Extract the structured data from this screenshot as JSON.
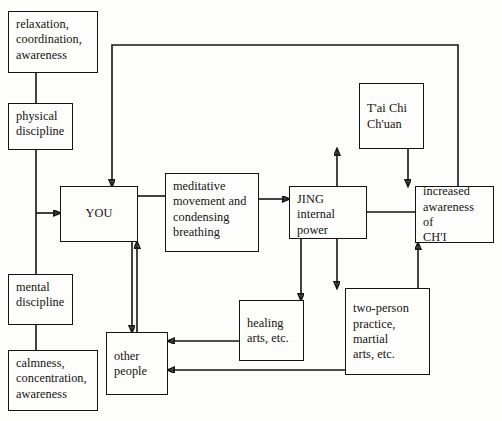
{
  "diagram": {
    "line_color": "#15140f",
    "background_color": "#fdfdfc",
    "nodes": [
      {
        "id": "relaxation",
        "label": "relaxation,\ncoordination,\nawareness",
        "x": 8,
        "y": 11,
        "w": 90,
        "h": 62
      },
      {
        "id": "physical",
        "label": "physical\ndiscipline",
        "x": 8,
        "y": 103,
        "w": 65,
        "h": 47
      },
      {
        "id": "mental",
        "label": "mental\ndiscipline",
        "x": 8,
        "y": 274,
        "w": 65,
        "h": 51
      },
      {
        "id": "calmness",
        "label": "calmness,\nconcentration,\nawareness",
        "x": 8,
        "y": 350,
        "w": 90,
        "h": 61
      },
      {
        "id": "you",
        "label": "YOU",
        "x": 60,
        "y": 186,
        "w": 78,
        "h": 56
      },
      {
        "id": "meditative",
        "label": "meditative\nmovement and\ncondensing\nbreathing",
        "x": 165,
        "y": 173,
        "w": 94,
        "h": 79
      },
      {
        "id": "jing",
        "label": "JING\ninternal\npower",
        "x": 289,
        "y": 186,
        "w": 78,
        "h": 53
      },
      {
        "id": "taichi",
        "label": "T'ai Chi\nCh'uan",
        "x": 359,
        "y": 83,
        "w": 65,
        "h": 66
      },
      {
        "id": "chi",
        "label": "increased\nawareness of\nCH'I",
        "x": 415,
        "y": 186,
        "w": 79,
        "h": 57
      },
      {
        "id": "healing",
        "label": "healing\narts, etc.",
        "x": 239,
        "y": 300,
        "w": 65,
        "h": 61
      },
      {
        "id": "twoperson",
        "label": "two-person\npractice,\nmartial\narts, etc.",
        "x": 345,
        "y": 288,
        "w": 85,
        "h": 87
      },
      {
        "id": "otherpeople",
        "label": "other\npeople",
        "x": 106,
        "y": 332,
        "w": 62,
        "h": 63
      }
    ],
    "edges": [
      {
        "id": "relaxation-physical",
        "from": "relaxation",
        "to": "physical",
        "arrow": false
      },
      {
        "id": "physical-you",
        "from": "physical",
        "to": "you",
        "arrow": true
      },
      {
        "id": "physical-mental-spine",
        "from": "physical",
        "to": "mental",
        "arrow": false
      },
      {
        "id": "mental-calmness",
        "from": "mental",
        "to": "calmness",
        "arrow": false
      },
      {
        "id": "chi-you-feedback",
        "from": "chi",
        "to": "you",
        "arrow": true
      },
      {
        "id": "you-meditative",
        "from": "you",
        "to": "meditative",
        "arrow": false
      },
      {
        "id": "meditative-jing",
        "from": "meditative",
        "to": "jing",
        "arrow": true
      },
      {
        "id": "jing-taichi",
        "from": "jing",
        "to": "taichi",
        "arrow": true
      },
      {
        "id": "taichi-chi",
        "from": "taichi",
        "to": "chi",
        "arrow": true
      },
      {
        "id": "jing-chi",
        "from": "jing",
        "to": "chi",
        "arrow": false
      },
      {
        "id": "jing-healing",
        "from": "jing",
        "to": "healing",
        "arrow": true
      },
      {
        "id": "jing-twoperson",
        "from": "jing",
        "to": "twoperson",
        "arrow": true
      },
      {
        "id": "twoperson-chi",
        "from": "twoperson",
        "to": "chi",
        "arrow": true
      },
      {
        "id": "healing-otherpeople",
        "from": "healing",
        "to": "otherpeople",
        "arrow": true
      },
      {
        "id": "twoperson-otherpeople",
        "from": "twoperson",
        "to": "otherpeople",
        "arrow": true
      },
      {
        "id": "otherpeople-you",
        "from": "otherpeople",
        "to": "you",
        "arrow": true
      },
      {
        "id": "you-otherpeople",
        "from": "you",
        "to": "otherpeople",
        "arrow": true
      }
    ]
  }
}
